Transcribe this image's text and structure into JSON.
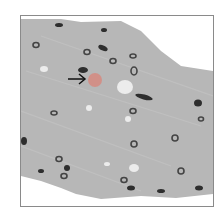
{
  "image": {
    "type": "histology-micrograph",
    "background_color": "#ffffff",
    "tissue_color": "#b5b5b5",
    "nucleus_color": "#3a3a3a",
    "highlight_color": "#ef8a7a",
    "arrow_color": "#111111"
  },
  "annotations": {
    "arrow": {
      "direction": "right",
      "target": "highlighted-cell"
    }
  }
}
